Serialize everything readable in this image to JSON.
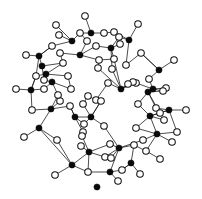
{
  "figure": {
    "caption": "",
    "background_color": "#ffffff",
    "width": 202,
    "height": 199
  },
  "legend": {
    "filled_label": "Si",
    "open_label": "O",
    "filled_color": "#0a0a0a",
    "open_color": "#ffffff",
    "bond_color": "#111111"
  },
  "chart_data": {
    "type": "diagram",
    "node_types": [
      "filled",
      "open"
    ],
    "counts": {
      "filled": 34,
      "open": 63,
      "bonds": 120
    },
    "style": {
      "filled_radius": 3.1,
      "open_radius": 3.3,
      "bond_width": 0.75
    },
    "nodes": [
      {
        "id": 0,
        "type": "open",
        "x": 85,
        "y": 16
      },
      {
        "id": 1,
        "type": "filled",
        "x": 91,
        "y": 33
      },
      {
        "id": 2,
        "type": "open",
        "x": 56,
        "y": 25
      },
      {
        "id": 3,
        "type": "filled",
        "x": 72,
        "y": 41
      },
      {
        "id": 4,
        "type": "open",
        "x": 80,
        "y": 33
      },
      {
        "id": 5,
        "type": "open",
        "x": 59,
        "y": 35
      },
      {
        "id": 6,
        "type": "open",
        "x": 104,
        "y": 33
      },
      {
        "id": 7,
        "type": "open",
        "x": 114,
        "y": 32
      },
      {
        "id": 8,
        "type": "filled",
        "x": 129,
        "y": 40
      },
      {
        "id": 9,
        "type": "open",
        "x": 138,
        "y": 24
      },
      {
        "id": 10,
        "type": "open",
        "x": 119,
        "y": 37
      },
      {
        "id": 11,
        "type": "open",
        "x": 87,
        "y": 41
      },
      {
        "id": 12,
        "type": "filled",
        "x": 111,
        "y": 48
      },
      {
        "id": 13,
        "type": "open",
        "x": 120,
        "y": 44
      },
      {
        "id": 14,
        "type": "open",
        "x": 96,
        "y": 46
      },
      {
        "id": 15,
        "type": "filled",
        "x": 80,
        "y": 55
      },
      {
        "id": 16,
        "type": "open",
        "x": 60,
        "y": 53
      },
      {
        "id": 17,
        "type": "open",
        "x": 26,
        "y": 55
      },
      {
        "id": 18,
        "type": "filled",
        "x": 42,
        "y": 66
      },
      {
        "id": 19,
        "type": "open",
        "x": 36,
        "y": 76
      },
      {
        "id": 20,
        "type": "open",
        "x": 44,
        "y": 80
      },
      {
        "id": 21,
        "type": "filled",
        "x": 52,
        "y": 82
      },
      {
        "id": 22,
        "type": "open",
        "x": 63,
        "y": 63
      },
      {
        "id": 23,
        "type": "open",
        "x": 114,
        "y": 59
      },
      {
        "id": 24,
        "type": "open",
        "x": 141,
        "y": 53
      },
      {
        "id": 25,
        "type": "filled",
        "x": 159,
        "y": 70
      },
      {
        "id": 26,
        "type": "open",
        "x": 174,
        "y": 60
      },
      {
        "id": 27,
        "type": "open",
        "x": 98,
        "y": 68
      },
      {
        "id": 28,
        "type": "open",
        "x": 112,
        "y": 69
      },
      {
        "id": 29,
        "type": "open",
        "x": 149,
        "y": 79
      },
      {
        "id": 30,
        "type": "filled",
        "x": 153,
        "y": 89
      },
      {
        "id": 31,
        "type": "open",
        "x": 166,
        "y": 88
      },
      {
        "id": 32,
        "type": "open",
        "x": 136,
        "y": 83
      },
      {
        "id": 33,
        "type": "filled",
        "x": 121,
        "y": 89
      },
      {
        "id": 34,
        "type": "open",
        "x": 108,
        "y": 83
      },
      {
        "id": 35,
        "type": "open",
        "x": 133,
        "y": 82
      },
      {
        "id": 36,
        "type": "open",
        "x": 128,
        "y": 84
      },
      {
        "id": 37,
        "type": "open",
        "x": 16,
        "y": 89
      },
      {
        "id": 38,
        "type": "filled",
        "x": 31,
        "y": 90
      },
      {
        "id": 39,
        "type": "open",
        "x": 44,
        "y": 89
      },
      {
        "id": 40,
        "type": "filled",
        "x": 148,
        "y": 92
      },
      {
        "id": 41,
        "type": "open",
        "x": 163,
        "y": 91
      },
      {
        "id": 42,
        "type": "open",
        "x": 96,
        "y": 100
      },
      {
        "id": 43,
        "type": "open",
        "x": 101,
        "y": 101
      },
      {
        "id": 44,
        "type": "open",
        "x": 60,
        "y": 101
      },
      {
        "id": 45,
        "type": "filled",
        "x": 51,
        "y": 109
      },
      {
        "id": 46,
        "type": "open",
        "x": 70,
        "y": 106
      },
      {
        "id": 47,
        "type": "open",
        "x": 138,
        "y": 104
      },
      {
        "id": 48,
        "type": "filled",
        "x": 169,
        "y": 110
      },
      {
        "id": 49,
        "type": "open",
        "x": 186,
        "y": 110
      },
      {
        "id": 50,
        "type": "open",
        "x": 156,
        "y": 108
      },
      {
        "id": 51,
        "type": "open",
        "x": 160,
        "y": 113
      },
      {
        "id": 52,
        "type": "open",
        "x": 32,
        "y": 110
      },
      {
        "id": 53,
        "type": "filled",
        "x": 150,
        "y": 116
      },
      {
        "id": 54,
        "type": "open",
        "x": 164,
        "y": 120
      },
      {
        "id": 55,
        "type": "filled",
        "x": 91,
        "y": 117
      },
      {
        "id": 56,
        "type": "filled",
        "x": 75,
        "y": 117
      },
      {
        "id": 57,
        "type": "open",
        "x": 84,
        "y": 124
      },
      {
        "id": 58,
        "type": "open",
        "x": 83,
        "y": 132
      },
      {
        "id": 59,
        "type": "open",
        "x": 104,
        "y": 126
      },
      {
        "id": 60,
        "type": "filled",
        "x": 39,
        "y": 128
      },
      {
        "id": 61,
        "type": "open",
        "x": 24,
        "y": 137
      },
      {
        "id": 62,
        "type": "open",
        "x": 57,
        "y": 140
      },
      {
        "id": 63,
        "type": "open",
        "x": 136,
        "y": 128
      },
      {
        "id": 64,
        "type": "filled",
        "x": 157,
        "y": 134
      },
      {
        "id": 65,
        "type": "open",
        "x": 172,
        "y": 142
      },
      {
        "id": 66,
        "type": "open",
        "x": 143,
        "y": 140
      },
      {
        "id": 67,
        "type": "open",
        "x": 82,
        "y": 136
      },
      {
        "id": 68,
        "type": "filled",
        "x": 89,
        "y": 152
      },
      {
        "id": 69,
        "type": "open",
        "x": 81,
        "y": 146
      },
      {
        "id": 70,
        "type": "open",
        "x": 110,
        "y": 144
      },
      {
        "id": 71,
        "type": "filled",
        "x": 119,
        "y": 148
      },
      {
        "id": 72,
        "type": "open",
        "x": 134,
        "y": 145
      },
      {
        "id": 73,
        "type": "open",
        "x": 146,
        "y": 151
      },
      {
        "id": 74,
        "type": "filled",
        "x": 72,
        "y": 165
      },
      {
        "id": 75,
        "type": "open",
        "x": 55,
        "y": 175
      },
      {
        "id": 76,
        "type": "open",
        "x": 105,
        "y": 157
      },
      {
        "id": 77,
        "type": "open",
        "x": 111,
        "y": 158
      },
      {
        "id": 78,
        "type": "filled",
        "x": 131,
        "y": 163
      },
      {
        "id": 79,
        "type": "open",
        "x": 88,
        "y": 172
      },
      {
        "id": 80,
        "type": "filled",
        "x": 110,
        "y": 172
      },
      {
        "id": 81,
        "type": "open",
        "x": 122,
        "y": 170
      },
      {
        "id": 82,
        "type": "open",
        "x": 140,
        "y": 174
      },
      {
        "id": 83,
        "type": "open",
        "x": 118,
        "y": 181
      },
      {
        "id": 84,
        "type": "filled",
        "x": 97,
        "y": 187
      },
      {
        "id": 85,
        "type": "open",
        "x": 99,
        "y": 60
      },
      {
        "id": 86,
        "type": "open",
        "x": 126,
        "y": 65
      },
      {
        "id": 87,
        "type": "filled",
        "x": 39,
        "y": 56
      },
      {
        "id": 88,
        "type": "open",
        "x": 52,
        "y": 46
      },
      {
        "id": 89,
        "type": "filled",
        "x": 46,
        "y": 74
      },
      {
        "id": 90,
        "type": "open",
        "x": 68,
        "y": 76
      },
      {
        "id": 91,
        "type": "open",
        "x": 71,
        "y": 89
      },
      {
        "id": 92,
        "type": "open",
        "x": 58,
        "y": 95
      },
      {
        "id": 93,
        "type": "open",
        "x": 83,
        "y": 104
      },
      {
        "id": 94,
        "type": "open",
        "x": 88,
        "y": 96
      },
      {
        "id": 95,
        "type": "open",
        "x": 177,
        "y": 132
      },
      {
        "id": 96,
        "type": "open",
        "x": 160,
        "y": 159
      }
    ],
    "bonds": [
      [
        0,
        1
      ],
      [
        1,
        4
      ],
      [
        1,
        6
      ],
      [
        4,
        3
      ],
      [
        3,
        2
      ],
      [
        3,
        5
      ],
      [
        3,
        88
      ],
      [
        88,
        87
      ],
      [
        6,
        7
      ],
      [
        7,
        8
      ],
      [
        8,
        9
      ],
      [
        8,
        10
      ],
      [
        10,
        12
      ],
      [
        12,
        13
      ],
      [
        12,
        14
      ],
      [
        12,
        23
      ],
      [
        14,
        15
      ],
      [
        15,
        11
      ],
      [
        15,
        16
      ],
      [
        15,
        85
      ],
      [
        11,
        4
      ],
      [
        16,
        22
      ],
      [
        22,
        89
      ],
      [
        87,
        17
      ],
      [
        87,
        19
      ],
      [
        87,
        88
      ],
      [
        87,
        18
      ],
      [
        18,
        22
      ],
      [
        18,
        20
      ],
      [
        19,
        38
      ],
      [
        20,
        21
      ],
      [
        21,
        39
      ],
      [
        21,
        91
      ],
      [
        21,
        92
      ],
      [
        89,
        19
      ],
      [
        89,
        20
      ],
      [
        89,
        90
      ],
      [
        90,
        91
      ],
      [
        38,
        37
      ],
      [
        38,
        39
      ],
      [
        38,
        52
      ],
      [
        38,
        19
      ],
      [
        23,
        33
      ],
      [
        23,
        85
      ],
      [
        85,
        27
      ],
      [
        27,
        33
      ],
      [
        86,
        8
      ],
      [
        86,
        24
      ],
      [
        24,
        25
      ],
      [
        25,
        26
      ],
      [
        25,
        29
      ],
      [
        25,
        24
      ],
      [
        29,
        30
      ],
      [
        30,
        31
      ],
      [
        30,
        32
      ],
      [
        30,
        41
      ],
      [
        32,
        33
      ],
      [
        33,
        34
      ],
      [
        33,
        35
      ],
      [
        33,
        36
      ],
      [
        33,
        28
      ],
      [
        28,
        12
      ],
      [
        40,
        30
      ],
      [
        40,
        41
      ],
      [
        40,
        47
      ],
      [
        40,
        50
      ],
      [
        40,
        51
      ],
      [
        34,
        42
      ],
      [
        42,
        43
      ],
      [
        43,
        55
      ],
      [
        93,
        55
      ],
      [
        94,
        93
      ],
      [
        94,
        42
      ],
      [
        44,
        45
      ],
      [
        45,
        46
      ],
      [
        45,
        52
      ],
      [
        45,
        60
      ],
      [
        46,
        56
      ],
      [
        44,
        92
      ],
      [
        92,
        45
      ],
      [
        47,
        53
      ],
      [
        48,
        49
      ],
      [
        48,
        50
      ],
      [
        48,
        51
      ],
      [
        48,
        95
      ],
      [
        48,
        53
      ],
      [
        53,
        51
      ],
      [
        53,
        54
      ],
      [
        53,
        63
      ],
      [
        53,
        64
      ],
      [
        55,
        56
      ],
      [
        55,
        57
      ],
      [
        55,
        59
      ],
      [
        55,
        43
      ],
      [
        56,
        57
      ],
      [
        56,
        58
      ],
      [
        56,
        46
      ],
      [
        58,
        67
      ],
      [
        67,
        68
      ],
      [
        68,
        69
      ],
      [
        68,
        70
      ],
      [
        68,
        74
      ],
      [
        68,
        79
      ],
      [
        59,
        71
      ],
      [
        60,
        61
      ],
      [
        60,
        62
      ],
      [
        60,
        74
      ],
      [
        62,
        74
      ],
      [
        63,
        64
      ],
      [
        64,
        65
      ],
      [
        64,
        66
      ],
      [
        64,
        95
      ],
      [
        64,
        73
      ],
      [
        66,
        71
      ],
      [
        71,
        70
      ],
      [
        71,
        72
      ],
      [
        71,
        76
      ],
      [
        71,
        77
      ],
      [
        71,
        80
      ],
      [
        72,
        73
      ],
      [
        73,
        96
      ],
      [
        74,
        75
      ],
      [
        74,
        79
      ],
      [
        76,
        68
      ],
      [
        80,
        79
      ],
      [
        80,
        81
      ],
      [
        80,
        83
      ],
      [
        81,
        78
      ],
      [
        78,
        82
      ],
      [
        78,
        72
      ],
      [
        78,
        81
      ],
      [
        84,
        84
      ]
    ]
  }
}
